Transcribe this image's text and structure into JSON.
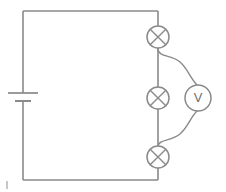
{
  "diagram": {
    "type": "electrical-schematic",
    "background_color": "#ffffff",
    "wire_color": "#8a8a8a",
    "component_fill": "#ffffff",
    "label_color": "#6f6f6f",
    "canvas": {
      "width": 226,
      "height": 192
    }
  },
  "components": {
    "battery": {
      "name": "battery",
      "symbol": "cell",
      "label": "",
      "position": {
        "x": 23,
        "y": 97
      },
      "long_plate": {
        "x1": 8,
        "x2": 38,
        "y": 93
      },
      "short_plate": {
        "x1": 15,
        "x2": 31,
        "y": 101
      }
    },
    "lamps": [
      {
        "name": "lamp-top",
        "symbol": "lamp-circle-cross",
        "label": "",
        "center": {
          "x": 158,
          "y": 37
        },
        "radius": 11
      },
      {
        "name": "lamp-middle",
        "symbol": "lamp-circle-cross",
        "label": "",
        "center": {
          "x": 158,
          "y": 98
        },
        "radius": 11
      },
      {
        "name": "lamp-bottom",
        "symbol": "lamp-circle-cross",
        "label": "",
        "center": {
          "x": 158,
          "y": 157
        },
        "radius": 11
      }
    ],
    "voltmeter": {
      "name": "voltmeter",
      "symbol": "circle-letter",
      "label": "V",
      "center": {
        "x": 198,
        "y": 98
      },
      "radius": 13
    }
  },
  "wires": {
    "outline": {
      "name": "main-loop",
      "top_left": {
        "x": 23,
        "y": 11
      },
      "top_right": {
        "x": 158,
        "y": 11
      },
      "bottom_left": {
        "x": 23,
        "y": 180
      },
      "bottom_right": {
        "x": 158,
        "y": 180
      }
    },
    "voltmeter_leads": [
      {
        "name": "voltmeter-lead-upper",
        "from": {
          "x": 158,
          "y": 50
        },
        "to": {
          "x": 198,
          "y": 85
        }
      },
      {
        "name": "voltmeter-lead-lower",
        "from": {
          "x": 158,
          "y": 145
        },
        "to": {
          "x": 198,
          "y": 111
        }
      }
    ]
  },
  "marks": {
    "corner_tick": {
      "name": "corner-tick-mark",
      "x": 7,
      "y_top": 181,
      "y_bottom": 189,
      "color": "#b9b9b9"
    }
  }
}
